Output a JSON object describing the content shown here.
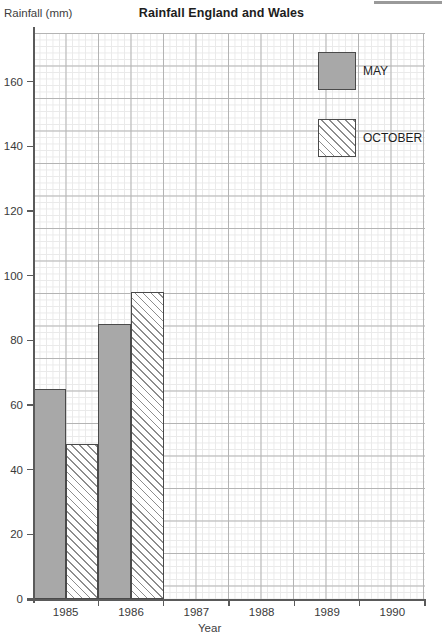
{
  "chart_data": {
    "type": "bar",
    "title": "Rainfall England and Wales",
    "xlabel": "Year",
    "ylabel": "Rainfall (mm)",
    "categories": [
      "1985",
      "1986",
      "1987",
      "1988",
      "1989",
      "1990"
    ],
    "series": [
      {
        "name": "MAY",
        "values": [
          65,
          85,
          null,
          null,
          null,
          null
        ]
      },
      {
        "name": "OCTOBER",
        "values": [
          48,
          95,
          null,
          null,
          null,
          null
        ]
      }
    ],
    "ylim": [
      0,
      175
    ],
    "yticks": [
      0,
      20,
      40,
      60,
      80,
      100,
      120,
      140,
      160
    ],
    "ytick_labels": [
      "0",
      "20",
      "40",
      "60",
      "80",
      "100",
      "120",
      "140",
      "160"
    ],
    "grid": true,
    "grid_style": "graph-paper",
    "legend_position": "top-right",
    "colors": {
      "may_fill": "#a8a8a8",
      "october_fill": "#ffffff",
      "october_hatch": "#8d8d8d",
      "bar_outline": "#4a4a4a",
      "axis": "#5a5a5a",
      "grid_major": "#b4b4b4",
      "grid_minor": "#e9e9e9",
      "text": "#1d1d1d"
    }
  },
  "legend": {
    "items": [
      {
        "label": "MAY",
        "swatch": "solid-gray-swatch"
      },
      {
        "label": "OCTOBER",
        "swatch": "hatched-swatch"
      }
    ]
  }
}
